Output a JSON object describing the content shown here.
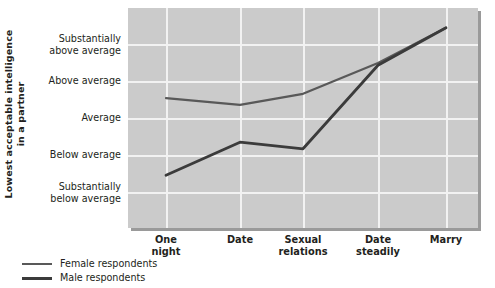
{
  "chart_data": {
    "type": "line",
    "title": "",
    "subtitle": "",
    "xlabel": "",
    "ylabel": "Lowest acceptable intelligence in a partner",
    "ylabel_lines": [
      "Lowest acceptable intelligence",
      "in a partner"
    ],
    "categories": [
      "One night",
      "Date",
      "Sexual relations",
      "Date steadily",
      "Marry"
    ],
    "category_lines": [
      [
        "One",
        "night"
      ],
      [
        "Date"
      ],
      [
        "Sexual",
        "relations"
      ],
      [
        "Date",
        "steadily"
      ],
      [
        "Marry"
      ]
    ],
    "ytick_labels": [
      "Substantially above average",
      "Above average",
      "Average",
      "Below average",
      "Substantially below average"
    ],
    "ytick_label_lines": [
      [
        "Substantially",
        "above average"
      ],
      [
        "Above average"
      ],
      [
        "Average"
      ],
      [
        "Below average"
      ],
      [
        "Substantially",
        "below average"
      ]
    ],
    "ytick_values": [
      5,
      4,
      3,
      2,
      1
    ],
    "ylim": [
      0.5,
      5.5
    ],
    "grid": true,
    "legend_position": "below-left",
    "series": [
      {
        "name": "Female respondents",
        "color": "#595959",
        "values": [
          3.45,
          3.3,
          3.55,
          4.25,
          5.05
        ]
      },
      {
        "name": "Male respondents",
        "color": "#3b3b3b",
        "values": [
          1.7,
          2.45,
          2.3,
          4.2,
          5.05
        ]
      }
    ]
  },
  "legend": {
    "items": [
      {
        "label": "Female respondents",
        "swatch": "female-line-swatch"
      },
      {
        "label": "Male respondents",
        "swatch": "male-line-swatch"
      }
    ]
  },
  "colors": {
    "plot_background": "#cbcbcb",
    "gridline": "#f2f2f2",
    "shadow": "#9a9a9a",
    "female_series": "#595959",
    "male_series": "#3b3b3b",
    "text": "#231f20"
  }
}
